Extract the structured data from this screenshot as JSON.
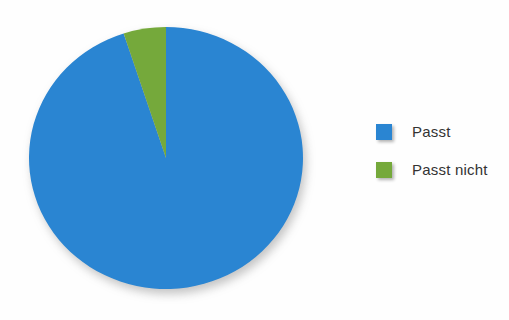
{
  "chart_data": {
    "type": "pie",
    "title": "",
    "slices": [
      {
        "label": "Passt",
        "value": 95,
        "color": "#2a85d2"
      },
      {
        "label": "Passt nicht",
        "value": 5,
        "color": "#75a93b"
      }
    ],
    "units": "percent",
    "start_angle_deg": 0,
    "direction": "clockwise",
    "legend_position": "right",
    "data_labels_shown": false
  }
}
